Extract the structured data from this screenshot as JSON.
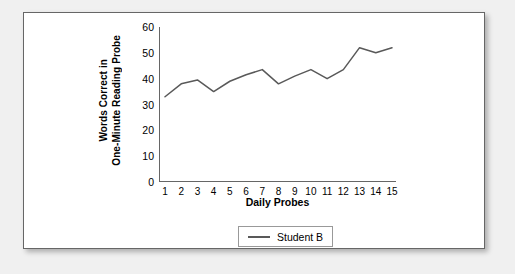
{
  "chart_data": {
    "type": "line",
    "title": "",
    "xlabel": "Daily Probes",
    "ylabel": "Words Correct in One-Minute Reading Probe",
    "ylabel_lines": [
      "Words Correct in",
      "One-Minute Reading Probe"
    ],
    "categories": [
      1,
      2,
      3,
      4,
      5,
      6,
      7,
      8,
      9,
      10,
      11,
      12,
      13,
      14,
      15
    ],
    "xticklabels": [
      "1",
      "2",
      "3",
      "4",
      "5",
      "6",
      "7",
      "8",
      "9",
      "10",
      "11",
      "12",
      "13",
      "14",
      "15"
    ],
    "yticks": [
      0,
      10,
      20,
      30,
      40,
      50,
      60
    ],
    "yticklabels": [
      "0",
      "10",
      "20",
      "30",
      "40",
      "50",
      "60"
    ],
    "ylim": [
      0,
      60
    ],
    "xlim": [
      1,
      15
    ],
    "grid": false,
    "legend_position": "bottom-center",
    "series": [
      {
        "name": "Student B",
        "color": "#595959",
        "values": [
          33,
          38,
          39.5,
          35,
          39,
          41.5,
          43.5,
          38,
          41,
          43.5,
          40,
          43.5,
          52,
          50,
          52
        ]
      }
    ]
  },
  "legend": {
    "entries": [
      {
        "label": "Student B"
      }
    ]
  }
}
